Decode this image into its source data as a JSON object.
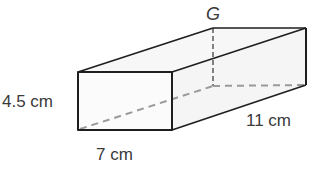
{
  "diagram": {
    "type": "rectangular-prism",
    "colors": {
      "edge": "#1e1e1e",
      "hidden_edge": "#9a9a9a",
      "label": "#3a3a3a",
      "face_fill": "#fbfbfb"
    },
    "labels": {
      "vertex_g": "G",
      "height": "4.5 cm",
      "width": "7 cm",
      "length": "11 cm"
    },
    "dimensions": {
      "height_cm": 4.5,
      "width_cm": 7,
      "length_cm": 11
    }
  }
}
